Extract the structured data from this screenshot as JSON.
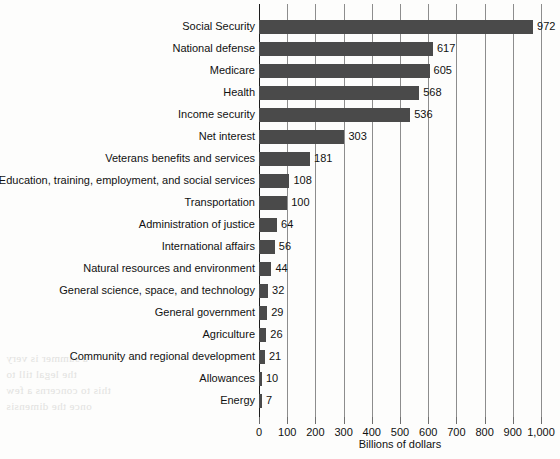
{
  "chart_data": {
    "type": "bar",
    "orientation": "horizontal",
    "title": "",
    "xlabel": "Billions of dollars",
    "ylabel": "",
    "xlim": [
      0,
      1000
    ],
    "xticks": [
      0,
      100,
      200,
      300,
      400,
      500,
      600,
      700,
      800,
      900,
      1000
    ],
    "xtick_labels": [
      "0",
      "100",
      "200",
      "300",
      "400",
      "500",
      "600",
      "700",
      "800",
      "900",
      "1,000"
    ],
    "grid": true,
    "legend": false,
    "bar_color": "#4a4a4a",
    "categories": [
      "Social Security",
      "National defense",
      "Medicare",
      "Health",
      "Income security",
      "Net interest",
      "Veterans benefits and services",
      "Education, training, employment, and social services",
      "Transportation",
      "Administration of justice",
      "International affairs",
      "Natural resources and environment",
      "General science, space, and technology",
      "General government",
      "Agriculture",
      "Community and regional development",
      "Allowances",
      "Energy"
    ],
    "values": [
      972,
      617,
      605,
      568,
      536,
      303,
      181,
      108,
      100,
      64,
      56,
      44,
      32,
      29,
      26,
      21,
      10,
      7
    ],
    "value_labels": [
      "972",
      "617",
      "605",
      "568",
      "536",
      "303",
      "181",
      "108",
      "100",
      "64",
      "56",
      "44",
      "32",
      "29",
      "26",
      "21",
      "10",
      "7"
    ]
  },
  "bleed_through": [
    "a summer is very",
    "the legal till to",
    "this to concerns a few",
    "once the dimensis"
  ]
}
